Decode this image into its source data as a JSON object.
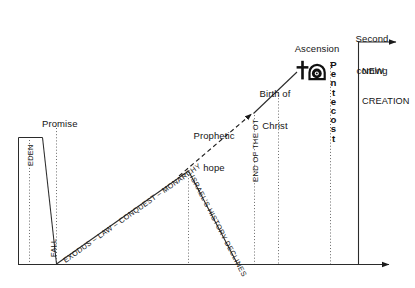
{
  "diagram": {
    "type": "line-diagram",
    "axis": {
      "baseline_label": "",
      "arrow_right": true
    },
    "labels": {
      "eden": "EDEN",
      "fall": "FALL",
      "promise": "Promise",
      "exodus_monarchy": "EXODUS – LAW – CONQUEST – MONARCHY",
      "israel_declines": "ISRAEL'S HISTORY DECLINES",
      "prophetic_hope_line1": "Prophetic",
      "prophetic_hope_line2": "hope",
      "end_of_ot": "END OF THE OT",
      "birth_of_christ_line1": "Birth of",
      "birth_of_christ_line2": "Christ",
      "ascension": "Ascension",
      "pentecost": "Pentecost",
      "pentecost_letters": [
        "P",
        "e",
        "n",
        "t",
        "e",
        "c",
        "o",
        "s",
        "t"
      ],
      "second_coming_line1": "Second",
      "second_coming_line2": "coming",
      "new_creation_line1": "NEW",
      "new_creation_line2": "CREATION"
    },
    "icons": {
      "cross": "cross-icon",
      "empty_tomb": "empty-tomb-icon",
      "axis_arrow": "arrow-right-icon",
      "prophetic_arrow": "arrow-up-right-icon",
      "new_creation_arrow": "arrow-right-icon"
    },
    "colors": {
      "ink": "#141414",
      "line": "#2b2b2b",
      "dotted": "#6d6d6d",
      "background": "#ffffff"
    },
    "geometry_note": "EDEN plateau falls to baseline at the Fall; rises through Exodus–Monarchy to a peak, declines through Israel's history, prophetic hope (dashed) rises to the Birth of Christ, then rises through Cross/Resurrection to Ascension and Pentecost; a vertical line marks the Second Coming, after which NEW CREATION extends right."
  }
}
